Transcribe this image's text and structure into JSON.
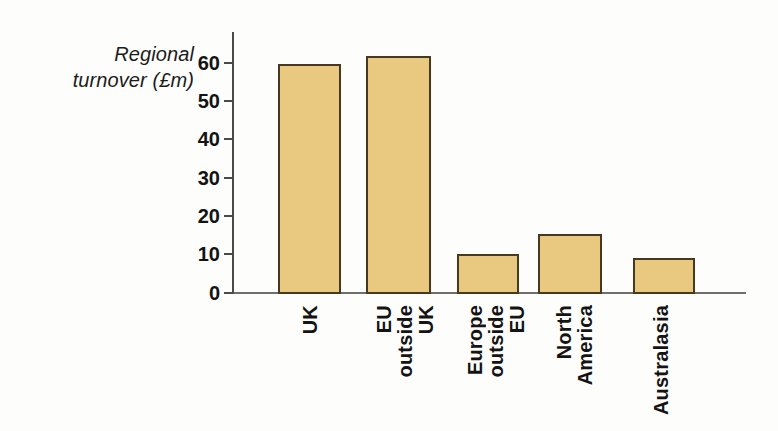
{
  "chart_data": {
    "type": "bar",
    "title": "",
    "subtitle": "",
    "xlabel": "",
    "ylabel": "Regional turnover (£m)",
    "ylabel_lines": [
      "Regional",
      "turnover (£m)"
    ],
    "categories": [
      "UK",
      "EU outside UK",
      "Europe outside EU",
      "North America",
      "Australasia"
    ],
    "category_label_lines": [
      [
        "UK"
      ],
      [
        "EU",
        "outside",
        "UK"
      ],
      [
        "Europe",
        "outside",
        "EU"
      ],
      [
        "North",
        "America"
      ],
      [
        "Australasia"
      ]
    ],
    "values": [
      59.5,
      61.5,
      10.3,
      15.6,
      9.2
    ],
    "ylim": [
      0,
      65
    ],
    "yticks": [
      0,
      10,
      20,
      30,
      40,
      50,
      60
    ],
    "ytick_labels": [
      "0",
      "10",
      "20",
      "30",
      "40",
      "50",
      "60"
    ],
    "grid": false,
    "legend": null,
    "legend_position": "none",
    "bar_fill_color": "#e9c87f",
    "bar_border_color": "#47381f",
    "axis_color": "#4a4a48",
    "text_color": "#131313"
  }
}
